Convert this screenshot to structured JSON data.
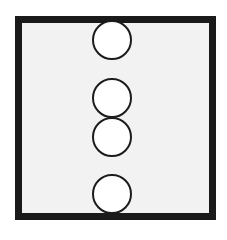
{
  "diagram": {
    "type": "circles-in-frame",
    "frame": {
      "shape": "square",
      "border_color": "#1a1a1a",
      "fill_color": "#f2f2f2"
    },
    "circles": [
      {
        "id": 1,
        "cx": 112,
        "cy": 40,
        "r": 20,
        "fill": "#ffffff",
        "stroke": "#1c1c1c"
      },
      {
        "id": 2,
        "cx": 112,
        "cy": 98,
        "r": 20,
        "fill": "#ffffff",
        "stroke": "#1c1c1c"
      },
      {
        "id": 3,
        "cx": 112,
        "cy": 137,
        "r": 20,
        "fill": "#ffffff",
        "stroke": "#1c1c1c"
      },
      {
        "id": 4,
        "cx": 112,
        "cy": 194,
        "r": 20,
        "fill": "#ffffff",
        "stroke": "#1c1c1c"
      }
    ],
    "circle_count": 4
  }
}
